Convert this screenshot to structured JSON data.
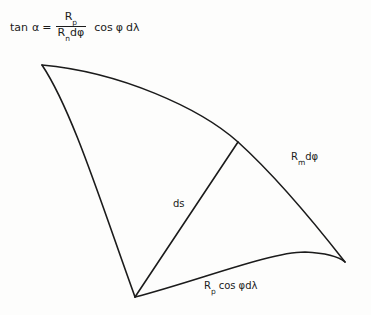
{
  "figure": {
    "background_color": "#fdfdfc",
    "ink_color": "#1b1b1b",
    "equation": {
      "lhs": "tan",
      "variable": "α",
      "equals": "=",
      "numerator_symbol": "R",
      "numerator_subscript": "p",
      "denominator_symbol": "R",
      "denominator_subscript": "n",
      "denominator_differential": "dφ",
      "rhs": "cos",
      "rhs_angle": "φ",
      "rhs_differential": "dλ",
      "plain_text": "tan α = R_p / (R_n dφ) cos φ dλ"
    },
    "labels": {
      "meridian_arc": {
        "symbol": "R",
        "subscript": "m",
        "differential": "dφ",
        "plain_text": "R_m dφ"
      },
      "arc_element": {
        "text": "ds"
      },
      "parallel_arc": {
        "symbol": "R",
        "subscript": "p",
        "cos": "cos",
        "angle_differential": "φdλ",
        "plain_text": "R_p cos φdλ"
      }
    },
    "geometry": {
      "vertices": {
        "top_left": [
          42,
          65
        ],
        "bottom": [
          135,
          297
        ],
        "upper_right_junction": [
          238,
          142
        ],
        "right": [
          345,
          262
        ]
      },
      "strokes": [
        {
          "name": "upper-curve",
          "type": "curve",
          "path": "M42,65 C120,72 200,108 238,142 C280,180 320,230 345,262"
        },
        {
          "name": "left-curve",
          "type": "curve",
          "path": "M42,65 C72,110 100,200 135,297"
        },
        {
          "name": "lower-curve",
          "type": "curve",
          "path": "M135,297 C200,280 270,252 305,252 C326,253 338,256 345,262"
        },
        {
          "name": "ds-diagonal",
          "type": "line",
          "path": "M135,297 L238,142"
        }
      ],
      "stroke_width": 1.6
    }
  }
}
